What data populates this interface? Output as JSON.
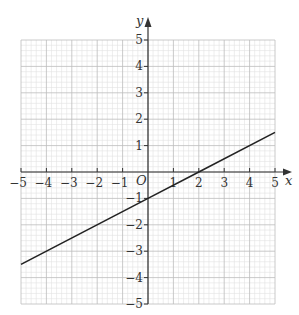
{
  "chart_data": {
    "type": "line",
    "title": "",
    "xlabel": "x",
    "ylabel": "y",
    "origin_label": "O",
    "xlim": [
      -5,
      5
    ],
    "ylim": [
      -5,
      5
    ],
    "grid": true,
    "minor_grid_divisions": 5,
    "x_ticks": [
      -5,
      -4,
      -3,
      -2,
      -1,
      1,
      2,
      3,
      4,
      5
    ],
    "y_ticks": [
      5,
      4,
      3,
      2,
      1,
      -1,
      -2,
      -3,
      -4,
      -5
    ],
    "x_tick_labels": [
      "−5",
      "−4",
      "−3",
      "−2",
      "−1",
      "1",
      "2",
      "3",
      "4",
      "5"
    ],
    "y_tick_labels": [
      "5",
      "4",
      "3",
      "2",
      "1",
      "−1",
      "−2",
      "−3",
      "−4",
      "−5"
    ],
    "series": [
      {
        "name": "y = 0.5x − 1",
        "equation": "y = 0.5x - 1",
        "x": [
          -5,
          0,
          2,
          5
        ],
        "y": [
          -3.5,
          -1,
          0,
          1.5
        ],
        "color": "#222222"
      }
    ],
    "legend": null
  },
  "colors": {
    "minor_grid": "#e2e2e2",
    "major_grid": "#bdbdbd",
    "axis": "#333333",
    "line": "#222222"
  },
  "layout": {
    "x0_px": 148,
    "y0_px": 172,
    "px_per_unit_x": 25.4,
    "px_per_unit_y": 26.4
  }
}
